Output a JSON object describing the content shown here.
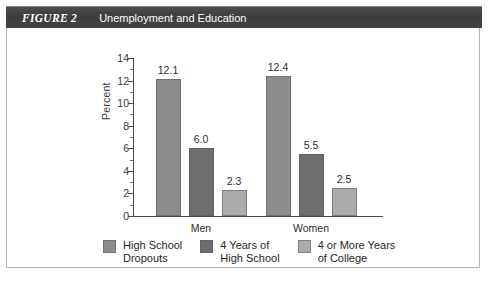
{
  "header": {
    "figure_label": "FIGURE 2",
    "title": "Unemployment and Education",
    "bar_color": "#3f3f3f",
    "text_color": "#ffffff"
  },
  "chart_data": {
    "type": "bar",
    "title": "Unemployment and Education",
    "xlabel": "",
    "ylabel": "Percent",
    "ylim": [
      0,
      14
    ],
    "ytick_values": [
      0,
      2,
      4,
      6,
      8,
      10,
      12,
      14
    ],
    "ytick_labels": [
      "0",
      "2",
      "4",
      "6",
      "8",
      "10",
      "12",
      "14"
    ],
    "grid": false,
    "legend_position": "bottom",
    "categories": [
      "Men",
      "Women"
    ],
    "series": [
      {
        "name": "High School Dropouts",
        "legend_label": "High School\nDropouts",
        "color": "#8c8c8c",
        "values": [
          12.1,
          12.4
        ],
        "value_labels": [
          "12.1",
          "12.4"
        ]
      },
      {
        "name": "4 Years of High School",
        "legend_label": "4 Years of\nHigh School",
        "color": "#6e6e6e",
        "values": [
          6.0,
          5.5
        ],
        "value_labels": [
          "6.0",
          "5.5"
        ]
      },
      {
        "name": "4 or More Years of College",
        "legend_label": "4 or More Years\nof College",
        "color": "#ababab",
        "values": [
          2.3,
          2.5
        ],
        "value_labels": [
          "2.3",
          "2.5"
        ]
      }
    ]
  },
  "axis": {
    "y_label": "Percent",
    "group_men": "Men",
    "group_women": "Women"
  }
}
